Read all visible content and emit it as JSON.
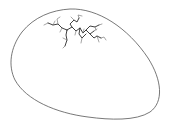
{
  "illustration": {
    "subject": "cracked egg",
    "colors": {
      "background": "#ffffff",
      "outline": "#555555",
      "crack_main": "#2a2a2a",
      "crack_branch": "#6a6a6a"
    }
  }
}
